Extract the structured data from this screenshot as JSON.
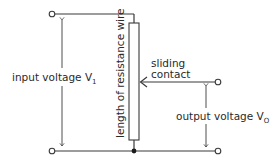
{
  "diagram": {
    "type": "potential-divider circuit",
    "labels": {
      "input_voltage": "input voltage V",
      "input_subscript": "1",
      "output_voltage": "output voltage V",
      "output_subscript": "O",
      "sliding_contact_line1": "sliding",
      "sliding_contact_line2": "contact",
      "resistance_wire": "length of resistance wire"
    },
    "colors": {
      "line": "#3a3a3a",
      "text": "#2a2a2a",
      "background": "#ffffff"
    }
  }
}
